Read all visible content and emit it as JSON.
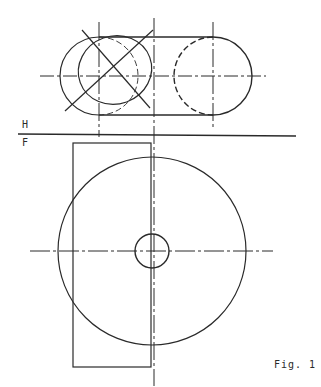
{
  "labels": {
    "plane_top": "H",
    "plane_bottom": "F",
    "figure": "Fig. 1"
  },
  "colors": {
    "ink": "#2a2a2a",
    "background": "#ffffff"
  },
  "drawing": {
    "top_view": {
      "left_circle_center": [
        99,
        76
      ],
      "left_circle_radius": 39,
      "right_circle_center": [
        213,
        76
      ],
      "right_circle_radius": 39,
      "ellipse_center": [
        108,
        72
      ],
      "ellipse_radii": [
        38,
        36
      ]
    },
    "fold_line_y": 135,
    "front_view": {
      "rectangle": [
        73,
        143,
        151,
        367
      ],
      "large_circle_center": [
        152,
        251
      ],
      "large_circle_radius": 94,
      "small_circle_center": [
        152,
        251
      ],
      "small_circle_radius": 17
    }
  }
}
